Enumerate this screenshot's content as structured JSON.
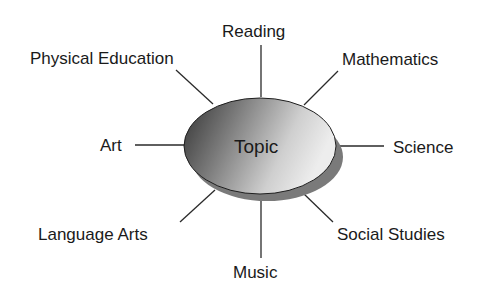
{
  "diagram": {
    "type": "web / concept map",
    "center": {
      "label": "Topic"
    },
    "colors": {
      "ellipse_dark": "#3a3a3a",
      "ellipse_light": "#e8e8e8",
      "shadow": "#777777",
      "line": "#2a2a2a",
      "text": "#1a1a1a"
    },
    "branches": [
      {
        "label": "Reading"
      },
      {
        "label": "Mathematics"
      },
      {
        "label": "Science"
      },
      {
        "label": "Social Studies"
      },
      {
        "label": "Music"
      },
      {
        "label": "Language Arts"
      },
      {
        "label": "Art"
      },
      {
        "label": "Physical Education"
      }
    ]
  }
}
